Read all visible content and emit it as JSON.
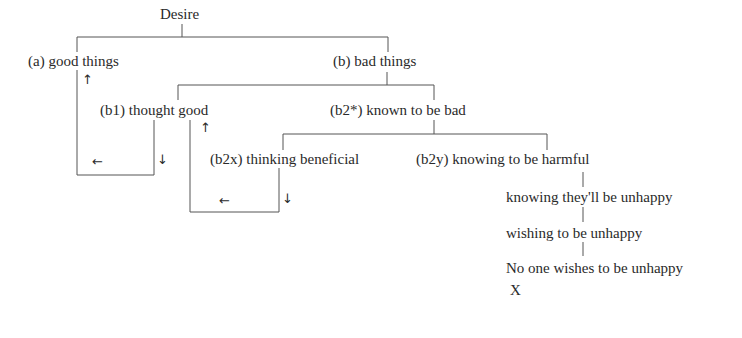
{
  "diagram": {
    "root": "Desire",
    "nodes": {
      "a": "(a) good things",
      "b": "(b) bad things",
      "b1": "(b1) thought good",
      "b2": "(b2*) known to be bad",
      "b2x": "(b2x) thinking beneficial",
      "b2y": "(b2y) knowing to be harmful",
      "step1": "knowing they'll be unhappy",
      "step2": "wishing to be unhappy",
      "step3": "No one wishes to be unhappy",
      "mark": "X"
    },
    "arrows": {
      "up": "↑",
      "down": "↓",
      "left": "←"
    }
  }
}
